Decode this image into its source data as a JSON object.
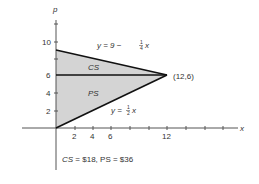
{
  "diagram": {
    "axes": {
      "x_label": "x",
      "y_label": "p",
      "x_ticks": [
        "2",
        "4",
        "6",
        "12"
      ],
      "y_ticks": [
        "2",
        "4",
        "6",
        "10"
      ]
    },
    "curves": {
      "demand_label_prefix": "y = 9 −",
      "demand_frac_num": "1",
      "demand_frac_den": "4",
      "demand_var": "x",
      "supply_label_prefix": "y =",
      "supply_frac_num": "1",
      "supply_frac_den": "2",
      "supply_var": "x"
    },
    "regions": {
      "consumer_surplus": "CS",
      "producer_surplus": "PS"
    },
    "equilibrium_point": "(12,6)",
    "caption": {
      "cs_label": "CS",
      "cs_value": " = $18, ",
      "ps_label": "PS",
      "ps_value": " = $36"
    },
    "colors": {
      "fill": "#d4d4d4",
      "line": "#111111",
      "axis": "#555555"
    }
  }
}
